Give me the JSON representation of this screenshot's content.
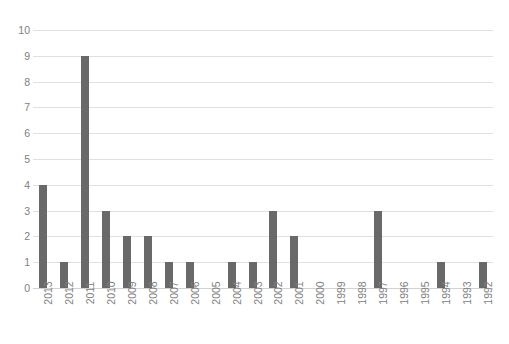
{
  "chart_data": {
    "type": "bar",
    "title": "",
    "subtitle": "",
    "xlabel": "",
    "ylabel": "",
    "ylim": [
      0,
      10
    ],
    "ytick_labels": [
      "10",
      "9",
      "8",
      "7",
      "6",
      "5",
      "4",
      "3",
      "2",
      "1",
      "0"
    ],
    "yticks": [
      10,
      9,
      8,
      7,
      6,
      5,
      4,
      3,
      2,
      1,
      0
    ],
    "grid": true,
    "legend": false,
    "legend_position": "none",
    "bar_color": "#696969",
    "gridline_color": "#e0e0e0",
    "tick_label_color": "#808080",
    "background_color": "#ffffff",
    "xtick_rotation": 90,
    "categories": [
      "2013",
      "2012",
      "2011",
      "2010",
      "2009",
      "2008",
      "2007",
      "2006",
      "2005",
      "2004",
      "2003",
      "2002",
      "2001",
      "2000",
      "1999",
      "1998",
      "1997",
      "1996",
      "1995",
      "1994",
      "1993",
      "1992"
    ],
    "values": [
      4,
      1,
      9,
      3,
      2,
      2,
      1,
      1,
      0,
      1,
      1,
      3,
      2,
      0,
      0,
      0,
      3,
      0,
      0,
      1,
      0,
      1
    ]
  }
}
